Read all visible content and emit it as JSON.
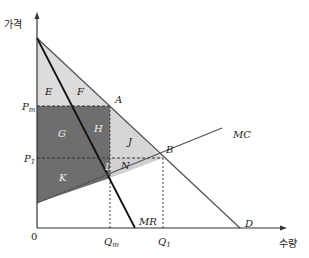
{
  "diagram": {
    "type": "monopoly-welfare",
    "axes": {
      "y_label": "가격",
      "x_label": "수량",
      "origin_label": "0"
    },
    "price_labels": {
      "pm": "P",
      "pm_sub": "m",
      "p1": "P",
      "p1_sub": "1"
    },
    "quantity_labels": {
      "qm": "Q",
      "qm_sub": "m",
      "q1": "Q",
      "q1_sub": "1"
    },
    "curves": {
      "demand": "D",
      "mr": "MR",
      "mc": "MC"
    },
    "points": {
      "a": "A",
      "b": "B"
    },
    "regions": {
      "e": "E",
      "f": "F",
      "g": "G",
      "h": "H",
      "j": "J",
      "k": "K",
      "l": "L",
      "n": "N"
    },
    "colors": {
      "light_region": "#d9d9d9",
      "dark_region": "#6e6e6e",
      "line": "#555555",
      "mr_line": "#111111"
    }
  }
}
